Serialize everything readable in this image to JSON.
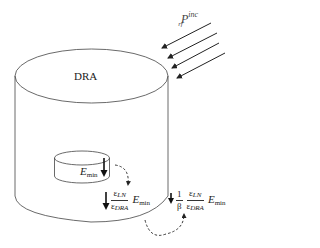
{
  "diagram": {
    "type": "DRA field ratio illustration",
    "labels": {
      "dra": "DRA",
      "incident_power": {
        "base": "P",
        "subscript": "rf",
        "superscript": "inc"
      },
      "inner_field": {
        "base": "E",
        "subscript": "min"
      },
      "middle_expression": {
        "numerator": {
          "base": "ε",
          "subscript": "LN"
        },
        "denominator": {
          "base": "ε",
          "subscript": "DRA"
        },
        "factor": {
          "base": "E",
          "subscript": "min"
        }
      },
      "outer_expression": {
        "coefficient_numerator": "1",
        "coefficient_denominator": "β",
        "numerator": {
          "base": "ε",
          "subscript": "LN"
        },
        "denominator": {
          "base": "ε",
          "subscript": "DRA"
        },
        "factor": {
          "base": "E",
          "subscript": "min"
        }
      }
    },
    "incident_arrow_count": 4,
    "colors": {
      "line": "#333333",
      "arrow": "#222222",
      "background": "#ffffff"
    }
  }
}
